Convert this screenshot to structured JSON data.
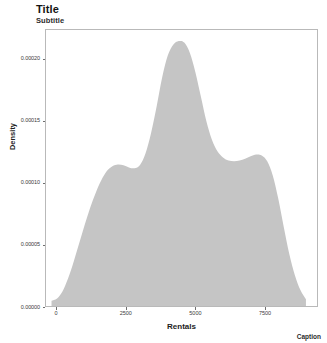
{
  "chart_data": {
    "type": "area",
    "title": "Title",
    "subtitle": "Subtitle",
    "caption": "Caption",
    "xlabel": "Rentals",
    "ylabel": "Density",
    "xlim": [
      -400,
      9400
    ],
    "ylim": [
      0,
      0.000224
    ],
    "xticks": [
      0,
      2500,
      5000,
      7500
    ],
    "xtick_labels": [
      "0",
      "2500",
      "5000",
      "7500"
    ],
    "yticks": [
      0,
      5e-05,
      0.0001,
      0.00015,
      0.0002
    ],
    "ytick_labels": [
      "0.00000",
      "0.00005",
      "0.00010",
      "0.00015",
      "0.00020"
    ],
    "grid": false,
    "legend": "none",
    "fill_color": "#c5c5c5",
    "panel_border_color": "#b9b9b9",
    "series": [
      {
        "name": "Density",
        "x": [
          -200,
          0,
          200,
          400,
          600,
          800,
          1000,
          1200,
          1400,
          1600,
          1800,
          2000,
          2200,
          2400,
          2600,
          2800,
          3000,
          3200,
          3400,
          3600,
          3800,
          4000,
          4200,
          4400,
          4600,
          4800,
          5000,
          5200,
          5400,
          5600,
          5800,
          6000,
          6200,
          6400,
          6600,
          6800,
          7000,
          7200,
          7400,
          7600,
          7800,
          8000,
          8200,
          8400,
          8600,
          8800,
          9000
        ],
        "values": [
          4.2e-06,
          6e-06,
          1.2e-05,
          2.25e-05,
          3.6e-05,
          5.1e-05,
          6.6e-05,
          8e-05,
          9.2e-05,
          0.000102,
          0.0001095,
          0.0001135,
          0.0001148,
          0.0001142,
          0.0001125,
          0.0001118,
          0.0001145,
          0.000124,
          0.0001405,
          0.000162,
          0.0001855,
          0.000203,
          0.000212,
          0.000215,
          0.0002138,
          0.0002055,
          0.00019,
          0.00017,
          0.00015,
          0.000135,
          0.0001255,
          0.0001205,
          0.000118,
          0.0001175,
          0.000118,
          0.0001195,
          0.0001215,
          0.000123,
          0.0001222,
          0.0001175,
          0.000106,
          8.7e-05,
          6.4e-05,
          4.2e-05,
          2.5e-05,
          1.3e-05,
          5.5e-06
        ]
      }
    ]
  }
}
